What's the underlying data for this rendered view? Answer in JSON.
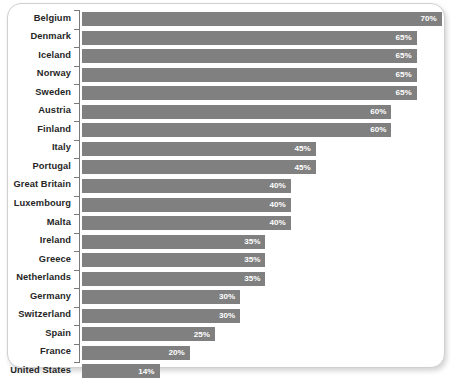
{
  "chart_data": {
    "type": "bar",
    "orientation": "horizontal",
    "title": "",
    "subtitle": "",
    "xlabel": "",
    "ylabel": "",
    "xlim": [
      0,
      70
    ],
    "grid": false,
    "legend": null,
    "value_suffix": "%",
    "bar_color": "#808080",
    "label_color": "#262626",
    "value_label_color": "#ffffff",
    "categories": [
      "Belgium",
      "Denmark",
      "Iceland",
      "Norway",
      "Sweden",
      "Austria",
      "Finland",
      "Italy",
      "Portugal",
      "Great Britain",
      "Luxembourg",
      "Malta",
      "Ireland",
      "Greece",
      "Netherlands",
      "Germany",
      "Switzerland",
      "Spain",
      "France",
      "United States"
    ],
    "values": [
      70,
      65,
      65,
      65,
      65,
      60,
      60,
      45,
      45,
      40,
      40,
      40,
      35,
      35,
      35,
      30,
      30,
      25,
      20,
      14
    ],
    "value_labels": [
      "70%",
      "65%",
      "65%",
      "65%",
      "65%",
      "60%",
      "60%",
      "45%",
      "45%",
      "40%",
      "40%",
      "40%",
      "35%",
      "35%",
      "35%",
      "30%",
      "30%",
      "25%",
      "20%",
      "14%"
    ]
  }
}
